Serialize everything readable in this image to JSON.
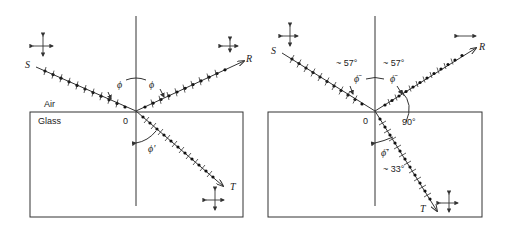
{
  "figure": {
    "panels": [
      {
        "id": "left",
        "media": {
          "upper": "Air",
          "lower": "Glass"
        },
        "origin_label": "0",
        "rays": {
          "incident": "S",
          "reflected": "R",
          "transmitted": "T"
        },
        "angles": {
          "incidence": "ϕ",
          "reflection": "ϕ",
          "refraction": "ϕ'"
        },
        "description": "General incidence: reflected and transmitted beams partially polarized"
      },
      {
        "id": "right",
        "origin_label": "0",
        "rays": {
          "incident": "S",
          "reflected": "R",
          "transmitted": "T"
        },
        "angles": {
          "incidence": "~ 57°",
          "incidence_symbol": "ϕ̄",
          "reflection": "~ 57°",
          "reflection_symbol": "ϕ̄",
          "between_R_T": "90°",
          "refraction": "~ 33°",
          "refraction_symbol": "ϕ̄'"
        },
        "description": "Brewster's angle incidence: reflected beam fully polarized"
      }
    ]
  }
}
